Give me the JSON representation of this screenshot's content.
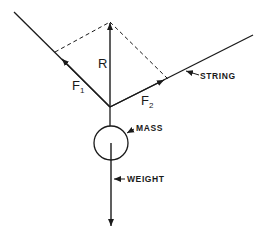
{
  "diagram": {
    "type": "force-diagram",
    "labels": {
      "resultant": "R",
      "force1": "F",
      "force1_sub": "1",
      "force2": "F",
      "force2_sub": "2",
      "string": "STRING",
      "mass": "MASS",
      "weight": "WEIGHT"
    },
    "colors": {
      "ink": "#1a1a1a",
      "background": "#ffffff"
    }
  }
}
